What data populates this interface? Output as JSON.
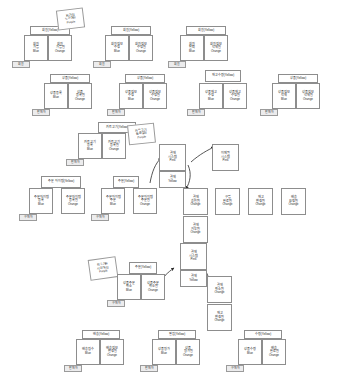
{
  "meta": {
    "canvas": {
      "width": 344,
      "height": 373,
      "background": "#ffffff"
    }
  },
  "legend": {
    "yellow": "Yellow",
    "blue": "Blue",
    "orange": "Orange",
    "pink": "Pink",
    "purple": "Purple"
  },
  "groups": [
    {
      "id": "g-member-join",
      "header": "회원(Yellow)",
      "command": {
        "l1": "회원",
        "l2": "가입",
        "color": "Blue"
      },
      "event": {
        "l1": "회원",
        "l2": "가입됨",
        "color": "Orange"
      },
      "actor": "회원"
    },
    {
      "id": "g-member-info",
      "header": "회원(Yellow)",
      "command": {
        "l1": "회원정보",
        "l2": "수정",
        "color": "Blue"
      },
      "event": {
        "l1": "회원정보",
        "l2": "수정됨",
        "color": "Orange"
      },
      "actor": "회원"
    },
    {
      "id": "g-member-leave",
      "header": "회원(Yellow)",
      "command": {
        "l1": "회원",
        "l2": "탈퇴",
        "color": "Blue"
      },
      "event": {
        "l1": "회원정보",
        "l2": "삭제됨",
        "color": "Orange"
      },
      "actor": "회원"
    },
    {
      "id": "g-product-reg",
      "header": "상품(Yellow)",
      "command": {
        "l1": "상품등록",
        "l2": "",
        "color": "Blue"
      },
      "event": {
        "l1": "상품",
        "l2": "등록됨",
        "color": "Orange"
      },
      "actor": "판매자"
    },
    {
      "id": "g-product-edit",
      "header": "상품(Yellow)",
      "command": {
        "l1": "상품정보",
        "l2": "수정",
        "color": "Blue"
      },
      "event": {
        "l1": "상품정보",
        "l2": "수정됨",
        "color": "Orange"
      },
      "actor": "판매자"
    },
    {
      "id": "g-stock",
      "header": "재고수량(Yellow)",
      "command": {
        "l1": "상품재고",
        "l2": "수정",
        "color": "Blue"
      },
      "event": {
        "l1": "상품재고",
        "l2": "수정됨",
        "color": "Orange"
      },
      "actor": "판매자"
    },
    {
      "id": "g-product-del",
      "header": "상품(Yellow)",
      "command": {
        "l1": "상품정보",
        "l2": "삭제",
        "color": "Blue"
      },
      "event": {
        "l1": "상품정보",
        "l2": "삭제됨",
        "color": "Orange"
      },
      "actor": "판매자"
    },
    {
      "id": "g-cart",
      "header": "카트고기(Yellow)",
      "command": {
        "l1": "카트고기",
        "l2": "등록",
        "color": "Blue"
      },
      "event": {
        "l1": "카트고기",
        "l2": "등록됨",
        "color": "Orange"
      },
      "actor": "판매자"
    },
    {
      "id": "g-order-item",
      "header": "주문 아이템(Yellow)",
      "command": {
        "l1": "주문아이템",
        "l2": "등록",
        "color": "Blue"
      },
      "event": {
        "l1": "주문아이템",
        "l2": "등록됨",
        "color": "Orange"
      },
      "actor": "구매자"
    },
    {
      "id": "g-order",
      "header": "주문(Yellow)",
      "command": {
        "l1": "주문아이템",
        "l2": "주문",
        "color": "Blue"
      },
      "event": {
        "l1": "주문아이템",
        "l2": "주문됨",
        "color": "Orange"
      },
      "actor": "구매자"
    },
    {
      "id": "g-cancel",
      "header": "주문(Yellow)",
      "command": {
        "l1": "상품주문",
        "l2": "취소",
        "color": "Blue"
      },
      "event": {
        "l1": "상품주문",
        "l2": "취소됨",
        "color": "Orange"
      },
      "actor": "구매자"
    },
    {
      "id": "g-delivery",
      "header": "배송(Yellow)",
      "command": {
        "l1": "배송접수",
        "l2": "",
        "color": "Blue"
      },
      "event": {
        "l1": "배송정보",
        "l2": "변경됨",
        "color": "Orange"
      },
      "actor": "판매자"
    },
    {
      "id": "g-review",
      "header": "별점(Yellow)",
      "command": {
        "l1": "상품평가",
        "l2": "",
        "color": "Blue"
      },
      "event": {
        "l1": "상품",
        "l2": "평가됨",
        "color": "Orange"
      },
      "actor": "판매자"
    },
    {
      "id": "g-receive",
      "header": "수령(Yellow)",
      "command": {
        "l1": "상품수령",
        "l2": "",
        "color": "Blue"
      },
      "event": {
        "l1": "배송",
        "l2": "완료됨",
        "color": "Orange"
      },
      "actor": "구매자"
    }
  ],
  "standalone_events": [
    {
      "id": "e-pay",
      "l1": "결제",
      "l2": "승인됨",
      "color": "Orange"
    },
    {
      "id": "e-buy",
      "l1": "구입",
      "l2": "완료됨",
      "color": "Orange"
    },
    {
      "id": "e-stock2",
      "l1": "재고",
      "l2": "변경됨",
      "color": "Orange"
    },
    {
      "id": "e-ship",
      "l1": "배송",
      "l2": "요청됨",
      "color": "Orange"
    },
    {
      "id": "e-pay-req",
      "l1": "결제",
      "l2": "거부됨",
      "color": "Orange"
    },
    {
      "id": "e-cancel",
      "l1": "결제",
      "l2": "취소됨",
      "color": "Orange"
    },
    {
      "id": "e-stock3",
      "l1": "재고",
      "l2": "변경됨",
      "color": "Orange"
    }
  ],
  "systems": [
    {
      "id": "sys-pay",
      "l1": "결제",
      "l2": "시스템",
      "color": "Pink"
    },
    {
      "id": "sys-mail",
      "l1": "이메일",
      "l2": "시스템",
      "color": "Pink"
    },
    {
      "id": "sys-pay2",
      "l1": "결제",
      "l2": "시스템",
      "color": "Pink"
    }
  ],
  "aggregates": [
    {
      "id": "agg-pay",
      "label": "결제",
      "color": "Yellow"
    },
    {
      "id": "agg-pay2",
      "label": "결제",
      "color": "Yellow"
    }
  ],
  "policies": [
    {
      "id": "p-join",
      "l1": "회가입",
      "l2": "도건확인",
      "color": "Purple"
    },
    {
      "id": "p-cart",
      "l1": "카트고기",
      "l2": "등록할인",
      "color": "Purple"
    },
    {
      "id": "p-cancel",
      "l1": "취소기한",
      "l2": "시원확인",
      "color": "Purple"
    }
  ]
}
